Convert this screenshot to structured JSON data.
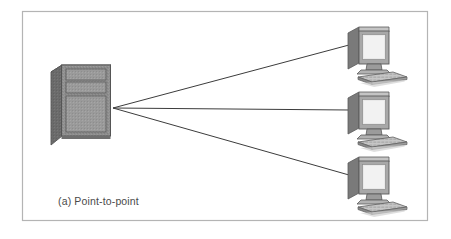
{
  "figure": {
    "caption": "(a) Point-to-point",
    "topology_type": "point-to-point",
    "frame": {
      "x": 22,
      "y": 11,
      "width": 406,
      "height": 210,
      "border_color": "#b4b4b4",
      "background_color": "#ffffff"
    }
  },
  "palette": {
    "page_background": "#ffffff",
    "frame_border": "#b4b4b4",
    "link_line": "#3c3c3c",
    "server_front": "#8e8e8e",
    "server_side": "#6b6b6b",
    "server_top": "#bdbdbd",
    "server_outline": "#555555",
    "panel_face": "#9a9a9a",
    "monitor_bezel": "#a8a8a8",
    "monitor_side": "#7a7a7a",
    "monitor_top": "#c4c4c4",
    "monitor_screen": "#e9e9e9",
    "monitor_outline": "#5a5a5a",
    "keyboard_face": "#c0c0c0",
    "keyboard_edge": "#6e6e6e",
    "caption_color": "#4a4a4a"
  },
  "server": {
    "label": "mainframe-server",
    "x": 50,
    "y": 65,
    "width": 60,
    "height": 80,
    "panel_count": 3,
    "panels": [
      {
        "name": "drive-bay-top"
      },
      {
        "name": "drive-bay-middle"
      },
      {
        "name": "front-door-panel"
      }
    ]
  },
  "hub_point": {
    "x": 113,
    "y": 108
  },
  "terminals": [
    {
      "name": "terminal-top",
      "index": 1,
      "x": 345,
      "y": 25,
      "connect_x": 348,
      "connect_y": 45
    },
    {
      "name": "terminal-middle",
      "index": 2,
      "x": 345,
      "y": 90,
      "connect_x": 348,
      "connect_y": 110
    },
    {
      "name": "terminal-bottom",
      "index": 3,
      "x": 345,
      "y": 155,
      "connect_x": 348,
      "connect_y": 175
    }
  ],
  "links": [
    {
      "name": "link-server-to-terminal-top",
      "from": "server",
      "to": "terminal-top"
    },
    {
      "name": "link-server-to-terminal-middle",
      "from": "server",
      "to": "terminal-middle"
    },
    {
      "name": "link-server-to-terminal-bottom",
      "from": "server",
      "to": "terminal-bottom"
    }
  ],
  "caption_position": {
    "x": 58,
    "y": 205
  }
}
